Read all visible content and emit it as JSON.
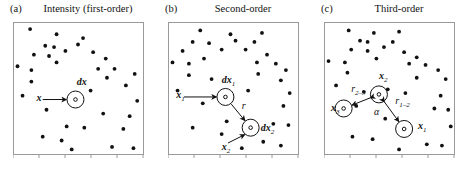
{
  "figure": {
    "background_color": "#ffffff",
    "frame_color": "#9a9a9a",
    "dot_color": "#111111",
    "annotation_color": "#111111"
  },
  "chart_data": {
    "type": "scatter",
    "title": "",
    "xlabel": "",
    "ylabel": "",
    "grid": false,
    "legend": null,
    "axis_ticks_labeled": false,
    "xlim": [
      0,
      100
    ],
    "ylim": [
      0,
      100
    ],
    "panels": [
      {
        "tag": "(a)",
        "title": "Intensity (first-order)",
        "n_points": 34,
        "points": [
          [
            12,
            96
          ],
          [
            33,
            92
          ],
          [
            54,
            89
          ],
          [
            24,
            83
          ],
          [
            31,
            82
          ],
          [
            50,
            84
          ],
          [
            15,
            76
          ],
          [
            27,
            75
          ],
          [
            40,
            79
          ],
          [
            62,
            78
          ],
          [
            33,
            70
          ],
          [
            72,
            73
          ],
          [
            2,
            67
          ],
          [
            13,
            64
          ],
          [
            66,
            65
          ],
          [
            79,
            65
          ],
          [
            73,
            58
          ],
          [
            95,
            61
          ],
          [
            13,
            55
          ],
          [
            88,
            52
          ],
          [
            97,
            40
          ],
          [
            25,
            33
          ],
          [
            91,
            28
          ],
          [
            41,
            20
          ],
          [
            55,
            19
          ],
          [
            86,
            18
          ],
          [
            22,
            12
          ],
          [
            37,
            9
          ],
          [
            77,
            4
          ],
          [
            94,
            3
          ],
          [
            45,
            2
          ],
          [
            60,
            48
          ],
          [
            6,
            44
          ],
          [
            70,
            30
          ]
        ],
        "annotations": [
          {
            "name": "dx-label",
            "text": "dx",
            "style": "bold-italic",
            "x": 49,
            "y": 53
          },
          {
            "name": "x-label",
            "text": "x",
            "style": "bold-italic",
            "x": 17,
            "y": 41
          },
          {
            "name": "leader-line",
            "text": "",
            "style": "line",
            "x": 0,
            "y": 0
          }
        ],
        "circles": [
          {
            "name": "dx-circle",
            "cx": 48,
            "cy": 41,
            "r_outer": 8.5,
            "r_inner": 1.8
          }
        ]
      },
      {
        "tag": "(b)",
        "title": "Second-order",
        "n_points": 34,
        "points": [
          [
            24,
            95
          ],
          [
            48,
            92
          ],
          [
            73,
            93
          ],
          [
            18,
            86
          ],
          [
            31,
            85
          ],
          [
            52,
            87
          ],
          [
            67,
            86
          ],
          [
            10,
            79
          ],
          [
            41,
            80
          ],
          [
            60,
            80
          ],
          [
            27,
            73
          ],
          [
            77,
            76
          ],
          [
            2,
            70
          ],
          [
            15,
            69
          ],
          [
            69,
            70
          ],
          [
            84,
            69
          ],
          [
            70,
            61
          ],
          [
            92,
            64
          ],
          [
            15,
            60
          ],
          [
            88,
            56
          ],
          [
            95,
            46
          ],
          [
            26,
            38
          ],
          [
            90,
            36
          ],
          [
            45,
            24
          ],
          [
            18,
            19
          ],
          [
            41,
            14
          ],
          [
            82,
            22
          ],
          [
            94,
            21
          ],
          [
            74,
            8
          ],
          [
            88,
            5
          ],
          [
            57,
            3
          ],
          [
            6,
            48
          ],
          [
            62,
            48
          ],
          [
            33,
            57
          ]
        ],
        "annotations": [
          {
            "name": "dx1-label",
            "text": "dx",
            "sub": "1",
            "style": "bold-italic",
            "x": 41,
            "y": 55
          },
          {
            "name": "x1-label",
            "text": "x",
            "sub": "1",
            "style": "bold-italic",
            "x": 5,
            "y": 43
          },
          {
            "name": "r-label",
            "text": "r",
            "style": "italic",
            "x": 57,
            "y": 34
          },
          {
            "name": "dx2-label",
            "text": "dx",
            "sub": "2",
            "style": "bold-italic",
            "x": 72,
            "y": 17
          },
          {
            "name": "x2-label",
            "text": "x",
            "sub": "2",
            "style": "bold-italic",
            "x": 41,
            "y": 2
          }
        ],
        "circles": [
          {
            "name": "dx1-circle",
            "cx": 44,
            "cy": 43,
            "r_outer": 8.5,
            "r_inner": 1.8
          },
          {
            "name": "dx2-circle",
            "cx": 64,
            "cy": 19,
            "r_outer": 8.5,
            "r_inner": 1.8
          }
        ],
        "arrows": [
          {
            "name": "r-arrow",
            "from": [
              44,
              43
            ],
            "to": [
              64,
              19
            ],
            "label": "r"
          }
        ]
      },
      {
        "tag": "(c)",
        "title": "Third-order",
        "n_points": 35,
        "points": [
          [
            18,
            95
          ],
          [
            38,
            93
          ],
          [
            58,
            94
          ],
          [
            27,
            87
          ],
          [
            33,
            86
          ],
          [
            53,
            86
          ],
          [
            20,
            80
          ],
          [
            33,
            79
          ],
          [
            46,
            82
          ],
          [
            62,
            78
          ],
          [
            40,
            73
          ],
          [
            72,
            74
          ],
          [
            2,
            71
          ],
          [
            15,
            70
          ],
          [
            66,
            69
          ],
          [
            79,
            68
          ],
          [
            17,
            62
          ],
          [
            89,
            64
          ],
          [
            72,
            58
          ],
          [
            95,
            57
          ],
          [
            91,
            44
          ],
          [
            24,
            36
          ],
          [
            86,
            34
          ],
          [
            97,
            33
          ],
          [
            47,
            26
          ],
          [
            21,
            12
          ],
          [
            37,
            10
          ],
          [
            80,
            6
          ],
          [
            92,
            5
          ],
          [
            99,
            20
          ],
          [
            58,
            2
          ],
          [
            8,
            52
          ],
          [
            63,
            46
          ],
          [
            49,
            49
          ],
          [
            30,
            47
          ]
        ],
        "annotations": [
          {
            "name": "x2-label",
            "text": "x",
            "sub": "2",
            "style": "bold-italic",
            "x": 42,
            "y": 58
          },
          {
            "name": "x3-label",
            "text": "x",
            "sub": "3",
            "style": "bold-italic",
            "x": 4,
            "y": 33
          },
          {
            "name": "x1-label",
            "text": "x",
            "sub": "1",
            "style": "bold-italic",
            "x": 73,
            "y": 19
          },
          {
            "name": "r23-label",
            "text": "r",
            "sub": "2–3",
            "style": "italic",
            "x": 20,
            "y": 48
          },
          {
            "name": "r12-label",
            "text": "r",
            "sub": "1–2",
            "style": "italic",
            "x": 55,
            "y": 38
          },
          {
            "name": "alpha-label",
            "text": "α",
            "style": "italic",
            "x": 38,
            "y": 30
          }
        ],
        "circles": [
          {
            "name": "x2-circle",
            "cx": 42,
            "cy": 45,
            "r_outer": 8.5,
            "r_inner": 1.8
          },
          {
            "name": "x3-circle",
            "cx": 14,
            "cy": 34,
            "r_outer": 8.5,
            "r_inner": 1.8
          },
          {
            "name": "x1-circle",
            "cx": 62,
            "cy": 18,
            "r_outer": 8.5,
            "r_inner": 1.8
          }
        ],
        "arrows": [
          {
            "name": "r23-arrow",
            "from": [
              42,
              45
            ],
            "to": [
              14,
              34
            ],
            "label": "r2-3",
            "double": true
          },
          {
            "name": "r12-arrow",
            "from": [
              42,
              45
            ],
            "to": [
              62,
              18
            ],
            "label": "r1-2",
            "double": true
          }
        ]
      }
    ]
  }
}
